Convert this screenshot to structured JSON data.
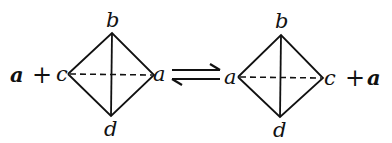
{
  "diagram": {
    "left": {
      "reactant": "a",
      "plus": "+",
      "vertices": {
        "top": "b",
        "bottom": "d",
        "left": "c",
        "right": "a"
      }
    },
    "arrow": {
      "type": "equilibrium",
      "symbol": "⇌"
    },
    "right": {
      "vertices": {
        "top": "b",
        "bottom": "d",
        "left": "a",
        "right": "c"
      },
      "plus": "+",
      "product": "a"
    }
  }
}
